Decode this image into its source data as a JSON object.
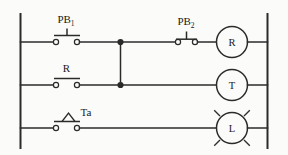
{
  "diagram": {
    "type": "ladder-logic-relay-control-circuit",
    "title": "",
    "background_color": "#fbfbf9",
    "line_color": "#2b2b2b",
    "rails": {
      "left_label": "",
      "right_label": ""
    },
    "rungs": [
      {
        "id": "rung-1",
        "contacts": [
          {
            "name": "PB1",
            "label": "PB",
            "subscript": "1",
            "kind": "pushbutton-normally-open",
            "symbol": "normally-open-pushbutton"
          },
          {
            "name": "PB2",
            "label": "PB",
            "subscript": "2",
            "kind": "pushbutton-normally-closed",
            "symbol": "normally-closed-pushbutton"
          }
        ],
        "output": {
          "name": "R",
          "label": "R",
          "kind": "relay-coil",
          "symbol": "circle"
        }
      },
      {
        "id": "rung-2",
        "contacts": [
          {
            "name": "R",
            "label": "R",
            "subscript": "",
            "kind": "contact-normally-open",
            "symbol": "normally-open-contact"
          }
        ],
        "output": {
          "name": "T",
          "label": "T",
          "kind": "timer-coil",
          "symbol": "circle"
        }
      },
      {
        "id": "rung-3",
        "contacts": [
          {
            "name": "Ta",
            "label": "Ta",
            "subscript": "",
            "kind": "timer-delay-contact",
            "symbol": "normally-open-contact-with-triangle"
          }
        ],
        "output": {
          "name": "L",
          "label": "L",
          "kind": "indicator-lamp",
          "symbol": "circle-with-rays"
        }
      }
    ],
    "junctions": [
      {
        "name": "node-rung1",
        "description": "branch junction on rung 1"
      },
      {
        "name": "node-rung2",
        "description": "branch junction on rung 2"
      }
    ]
  }
}
